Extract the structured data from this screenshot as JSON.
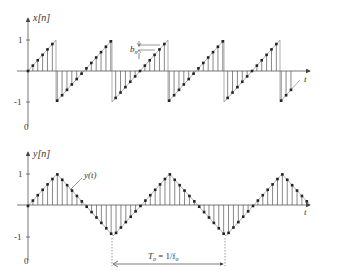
{
  "diagram": {
    "top_plot": {
      "y_label": "x[n]",
      "x_label": "t",
      "tick_pos": "1",
      "tick_neg": "-1",
      "origin_label": "0",
      "annotation": "b",
      "annotation_sub": "x",
      "signal_type": "sampled sawtooth"
    },
    "bottom_plot": {
      "y_label": "y[n]",
      "x_label": "t",
      "tick_pos": "1",
      "tick_neg": "-1",
      "origin_label": "0",
      "curve_label": "y(t)",
      "period_label": "T",
      "period_sub": "o",
      "period_eq": " = 1/f",
      "period_eq_sub": "o",
      "signal_type": "sampled triangle"
    },
    "colors": {
      "line": "#555555",
      "dot": "#222222",
      "text": "#333333"
    }
  }
}
